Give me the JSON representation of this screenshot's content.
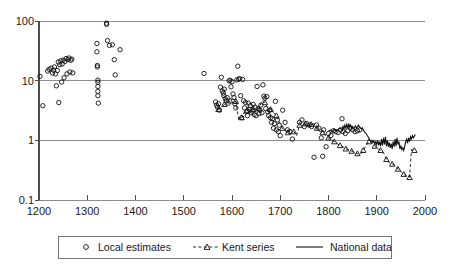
{
  "chart_data": {
    "type": "scatter",
    "title": "",
    "subtitle": "",
    "xlabel": "",
    "ylabel": "",
    "xlim": [
      1200,
      2000
    ],
    "ylim": [
      0.1,
      100
    ],
    "yscale": "log",
    "grid": "horizontal",
    "legend_position": "bottom",
    "x_ticks": [
      1200,
      1300,
      1400,
      1500,
      1600,
      1700,
      1800,
      1900,
      2000
    ],
    "x_tick_labels": [
      "1200",
      "1300",
      "1400",
      "1500",
      "1600",
      "1700",
      "1800",
      "1900",
      "2000"
    ],
    "y_ticks": [
      0.1,
      1,
      10,
      100
    ],
    "y_tick_labels": [
      "0.1",
      "1",
      "10",
      "100"
    ],
    "series": [
      {
        "name": "Local estimates",
        "marker": "circle",
        "line": "none",
        "points": [
          [
            1202,
            11.8
          ],
          [
            1208,
            3.8
          ],
          [
            1218,
            14.5
          ],
          [
            1221,
            15.5
          ],
          [
            1225,
            16.2
          ],
          [
            1228,
            13.5
          ],
          [
            1230,
            15.0
          ],
          [
            1232,
            17.0
          ],
          [
            1234,
            13.0
          ],
          [
            1236,
            8.2
          ],
          [
            1238,
            14.8
          ],
          [
            1240,
            20.5
          ],
          [
            1241,
            4.3
          ],
          [
            1243,
            18.5
          ],
          [
            1245,
            21.5
          ],
          [
            1247,
            9.5
          ],
          [
            1248,
            19.0
          ],
          [
            1250,
            22.0
          ],
          [
            1252,
            11.2
          ],
          [
            1254,
            21.0
          ],
          [
            1256,
            23.5
          ],
          [
            1258,
            13.0
          ],
          [
            1260,
            22.5
          ],
          [
            1262,
            24.0
          ],
          [
            1264,
            14.0
          ],
          [
            1266,
            22.0
          ],
          [
            1268,
            23.0
          ],
          [
            1270,
            13.5
          ],
          [
            1320,
            42.0
          ],
          [
            1320,
            30.5
          ],
          [
            1321,
            18.0
          ],
          [
            1321,
            17.0
          ],
          [
            1322,
            10.2
          ],
          [
            1322,
            9.4
          ],
          [
            1322,
            8.0
          ],
          [
            1322,
            6.6
          ],
          [
            1322,
            5.6
          ],
          [
            1323,
            4.2
          ],
          [
            1340,
            88.0
          ],
          [
            1340,
            92.0
          ],
          [
            1342,
            47.0
          ],
          [
            1346,
            39.0
          ],
          [
            1352,
            40.0
          ],
          [
            1356,
            22.5
          ],
          [
            1358,
            12.5
          ],
          [
            1368,
            33.0
          ],
          [
            1542,
            13.2
          ],
          [
            1566,
            4.4
          ],
          [
            1568,
            3.9
          ],
          [
            1570,
            3.6
          ],
          [
            1572,
            4.1
          ],
          [
            1574,
            3.2
          ],
          [
            1576,
            7.8
          ],
          [
            1578,
            11.4
          ],
          [
            1580,
            6.7
          ],
          [
            1582,
            6.2
          ],
          [
            1583,
            5.6
          ],
          [
            1584,
            7.2
          ],
          [
            1586,
            5.0
          ],
          [
            1588,
            4.6
          ],
          [
            1590,
            5.2
          ],
          [
            1592,
            4.2
          ],
          [
            1594,
            9.9
          ],
          [
            1596,
            10.2
          ],
          [
            1598,
            7.9
          ],
          [
            1600,
            9.6
          ],
          [
            1602,
            6.0
          ],
          [
            1604,
            5.2
          ],
          [
            1606,
            4.1
          ],
          [
            1608,
            3.5
          ],
          [
            1610,
            10.3
          ],
          [
            1612,
            17.5
          ],
          [
            1614,
            10.6
          ],
          [
            1616,
            10.8
          ],
          [
            1618,
            5.6
          ],
          [
            1620,
            2.4
          ],
          [
            1622,
            10.5
          ],
          [
            1624,
            4.6
          ],
          [
            1626,
            3.5
          ],
          [
            1628,
            4.3
          ],
          [
            1630,
            3.0
          ],
          [
            1632,
            2.6
          ],
          [
            1634,
            4.2
          ],
          [
            1636,
            3.3
          ],
          [
            1638,
            3.8
          ],
          [
            1640,
            2.9
          ],
          [
            1642,
            3.1
          ],
          [
            1644,
            4.0
          ],
          [
            1646,
            2.7
          ],
          [
            1648,
            3.6
          ],
          [
            1650,
            2.6
          ],
          [
            1652,
            8.0
          ],
          [
            1654,
            3.4
          ],
          [
            1656,
            2.8
          ],
          [
            1658,
            3.2
          ],
          [
            1660,
            3.9
          ],
          [
            1662,
            2.9
          ],
          [
            1664,
            8.5
          ],
          [
            1666,
            5.5
          ],
          [
            1668,
            5.1
          ],
          [
            1670,
            3.4
          ],
          [
            1672,
            5.4
          ],
          [
            1674,
            3.0
          ],
          [
            1676,
            2.6
          ],
          [
            1678,
            3.2
          ],
          [
            1680,
            2.4
          ],
          [
            1682,
            2.0
          ],
          [
            1684,
            2.3
          ],
          [
            1686,
            1.6
          ],
          [
            1688,
            1.9
          ],
          [
            1690,
            4.5
          ],
          [
            1692,
            1.5
          ],
          [
            1694,
            2.2
          ],
          [
            1696,
            1.4
          ],
          [
            1698,
            1.8
          ],
          [
            1700,
            1.2
          ],
          [
            1705,
            3.2
          ],
          [
            1710,
            2.0
          ],
          [
            1715,
            1.5
          ],
          [
            1720,
            1.4
          ],
          [
            1725,
            1.05
          ],
          [
            1740,
            2.0
          ],
          [
            1745,
            2.2
          ],
          [
            1750,
            1.7
          ],
          [
            1755,
            1.9
          ],
          [
            1760,
            1.8
          ],
          [
            1765,
            1.7
          ],
          [
            1770,
            0.52
          ],
          [
            1775,
            1.8
          ],
          [
            1780,
            1.6
          ],
          [
            1785,
            1.1
          ],
          [
            1788,
            0.54
          ],
          [
            1790,
            1.5
          ],
          [
            1795,
            0.78
          ],
          [
            1800,
            1.3
          ],
          [
            1805,
            1.2
          ],
          [
            1810,
            1.45
          ],
          [
            1815,
            1.4
          ],
          [
            1820,
            1.35
          ],
          [
            1825,
            1.5
          ],
          [
            1828,
            2.3
          ],
          [
            1830,
            1.4
          ],
          [
            1835,
            1.3
          ],
          [
            1840,
            1.45
          ],
          [
            1845,
            1.6
          ],
          [
            1850,
            1.5
          ],
          [
            1855,
            1.4
          ],
          [
            1860,
            1.45
          ],
          [
            1865,
            1.5
          ]
        ]
      },
      {
        "name": "Kent series",
        "marker": "triangle",
        "line": "dashed",
        "points": [
          [
            1572,
            3.3
          ],
          [
            1578,
            3.5
          ],
          [
            1584,
            4.0
          ],
          [
            1590,
            4.3
          ],
          [
            1596,
            4.6
          ],
          [
            1602,
            5.0
          ],
          [
            1608,
            4.5
          ],
          [
            1614,
            2.2
          ],
          [
            1620,
            2.4
          ],
          [
            1626,
            3.0
          ],
          [
            1632,
            3.2
          ],
          [
            1638,
            3.3
          ],
          [
            1644,
            3.3
          ],
          [
            1650,
            3.2
          ],
          [
            1656,
            3.4
          ],
          [
            1662,
            4.6
          ],
          [
            1668,
            4.3
          ],
          [
            1674,
            3.5
          ],
          [
            1680,
            3.3
          ],
          [
            1686,
            2.9
          ],
          [
            1692,
            2.6
          ],
          [
            1698,
            2.0
          ],
          [
            1704,
            1.6
          ],
          [
            1710,
            1.5
          ],
          [
            1716,
            1.35
          ],
          [
            1722,
            1.5
          ],
          [
            1728,
            1.4
          ],
          [
            1734,
            1.2
          ],
          [
            1740,
            1.8
          ],
          [
            1746,
            2.0
          ],
          [
            1752,
            1.9
          ],
          [
            1758,
            1.7
          ],
          [
            1764,
            1.85
          ],
          [
            1770,
            1.9
          ],
          [
            1776,
            1.6
          ],
          [
            1782,
            1.4
          ],
          [
            1788,
            1.35
          ],
          [
            1794,
            1.2
          ],
          [
            1800,
            1.1
          ],
          [
            1806,
            1.0
          ],
          [
            1812,
            0.95
          ],
          [
            1818,
            0.88
          ],
          [
            1824,
            0.82
          ],
          [
            1830,
            0.78
          ],
          [
            1836,
            0.72
          ],
          [
            1842,
            0.7
          ],
          [
            1848,
            0.66
          ],
          [
            1854,
            0.62
          ],
          [
            1860,
            0.6
          ],
          [
            1866,
            0.58
          ],
          [
            1872,
            0.68
          ],
          [
            1878,
            0.82
          ],
          [
            1884,
            0.95
          ],
          [
            1890,
            0.92
          ],
          [
            1896,
            0.8
          ],
          [
            1902,
            0.72
          ],
          [
            1908,
            0.68
          ],
          [
            1914,
            0.62
          ],
          [
            1920,
            0.48
          ],
          [
            1926,
            0.42
          ],
          [
            1932,
            0.4
          ],
          [
            1938,
            0.38
          ],
          [
            1944,
            0.33
          ],
          [
            1950,
            0.3
          ],
          [
            1956,
            0.27
          ],
          [
            1962,
            0.25
          ],
          [
            1968,
            0.24
          ],
          [
            1972,
            0.7
          ],
          [
            1978,
            0.68
          ]
        ]
      },
      {
        "name": "National data",
        "marker": "none",
        "line": "solid",
        "points": [
          [
            1800,
            1.42
          ],
          [
            1804,
            1.48
          ],
          [
            1808,
            1.4
          ],
          [
            1812,
            1.55
          ],
          [
            1816,
            1.45
          ],
          [
            1820,
            1.52
          ],
          [
            1824,
            1.6
          ],
          [
            1828,
            1.5
          ],
          [
            1830,
            1.72
          ],
          [
            1832,
            1.55
          ],
          [
            1834,
            1.8
          ],
          [
            1836,
            1.6
          ],
          [
            1838,
            1.85
          ],
          [
            1840,
            1.62
          ],
          [
            1842,
            1.9
          ],
          [
            1844,
            1.65
          ],
          [
            1846,
            1.8
          ],
          [
            1848,
            1.6
          ],
          [
            1850,
            1.7
          ],
          [
            1852,
            1.58
          ],
          [
            1854,
            1.65
          ],
          [
            1856,
            1.75
          ],
          [
            1858,
            1.6
          ],
          [
            1860,
            1.68
          ],
          [
            1862,
            1.8
          ],
          [
            1864,
            1.7
          ],
          [
            1866,
            1.62
          ],
          [
            1868,
            1.55
          ],
          [
            1870,
            1.62
          ],
          [
            1872,
            1.5
          ],
          [
            1874,
            1.4
          ],
          [
            1876,
            1.35
          ],
          [
            1878,
            1.3
          ],
          [
            1880,
            1.22
          ],
          [
            1882,
            1.15
          ],
          [
            1884,
            1.08
          ],
          [
            1886,
            1.0
          ],
          [
            1888,
            0.95
          ],
          [
            1890,
            1.0
          ],
          [
            1892,
            0.92
          ],
          [
            1894,
            0.98
          ],
          [
            1896,
            0.88
          ],
          [
            1898,
            0.95
          ],
          [
            1900,
            0.85
          ],
          [
            1902,
            1.0
          ],
          [
            1904,
            0.82
          ],
          [
            1906,
            0.95
          ],
          [
            1908,
            0.8
          ],
          [
            1910,
            1.05
          ],
          [
            1912,
            0.82
          ],
          [
            1914,
            1.1
          ],
          [
            1916,
            0.85
          ],
          [
            1918,
            1.15
          ],
          [
            1920,
            0.8
          ],
          [
            1922,
            1.0
          ],
          [
            1924,
            0.78
          ],
          [
            1926,
            0.92
          ],
          [
            1928,
            0.75
          ],
          [
            1930,
            0.88
          ],
          [
            1932,
            0.72
          ],
          [
            1934,
            0.95
          ],
          [
            1936,
            0.78
          ],
          [
            1938,
            1.05
          ],
          [
            1940,
            0.8
          ],
          [
            1942,
            1.1
          ],
          [
            1944,
            0.85
          ],
          [
            1946,
            0.95
          ],
          [
            1948,
            0.72
          ],
          [
            1950,
            0.8
          ],
          [
            1952,
            0.7
          ],
          [
            1954,
            0.75
          ],
          [
            1956,
            0.68
          ],
          [
            1958,
            0.8
          ],
          [
            1960,
            0.95
          ],
          [
            1962,
            1.05
          ],
          [
            1964,
            0.9
          ],
          [
            1966,
            1.1
          ],
          [
            1968,
            0.95
          ],
          [
            1970,
            1.15
          ],
          [
            1972,
            1.05
          ],
          [
            1974,
            1.2
          ],
          [
            1976,
            1.1
          ],
          [
            1980,
            1.25
          ]
        ]
      }
    ]
  },
  "axes": {
    "y_labels": [
      "100",
      "10",
      "1",
      "0.1"
    ],
    "x_labels": [
      "1200",
      "1300",
      "1400",
      "1500",
      "1600",
      "1700",
      "1800",
      "1900",
      "2000"
    ]
  },
  "legend": {
    "items": [
      {
        "label": "Local estimates",
        "marker": "circle",
        "line": "none"
      },
      {
        "label": "Kent series",
        "marker": "triangle",
        "line": "dashed"
      },
      {
        "label": "National data",
        "marker": "none",
        "line": "solid"
      }
    ]
  },
  "colors": {
    "ink": "#111111",
    "grid": "#8c8c8c",
    "axis": "#4d4d4d",
    "background": "#ffffff"
  }
}
